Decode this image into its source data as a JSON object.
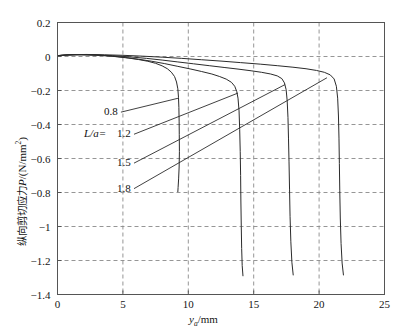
{
  "figure": {
    "background_color": "#ffffff",
    "axis_color": "#555555",
    "grid_color": "#8a8a8a",
    "curve_color": "#2b2b2b"
  },
  "chart_data": {
    "type": "line",
    "title": "",
    "xlabel": "y_a/mm",
    "xlabel_parts": {
      "symbol": "y",
      "subscript": "a",
      "unit": "/mm"
    },
    "ylabel": "纵向剪切应力P/(N/mm²)",
    "ylabel_parts": {
      "chinese": "纵向剪切应力",
      "symbol": "P",
      "unit": "/(N/mm",
      "exponent": "2",
      "unit_close": ")"
    },
    "xlim": [
      0,
      25
    ],
    "ylim": [
      -1.4,
      0.2
    ],
    "xticks": [
      0,
      5,
      10,
      15,
      20,
      25
    ],
    "xtick_labels": [
      "0",
      "5",
      "10",
      "15",
      "20",
      "25"
    ],
    "yticks": [
      0.2,
      0,
      -0.2,
      -0.4,
      -0.6,
      -0.8,
      -1,
      -1.2,
      -1.4
    ],
    "ytick_labels": [
      "0.2",
      "0",
      "−0.2",
      "−0.4",
      "−0.6",
      "−0.8",
      "−1",
      "−1.2",
      "−1.4"
    ],
    "grid": true,
    "grid_style": "dashed",
    "legend_position": "inline-annotations",
    "series_prefix_label": "L/a=",
    "series": [
      {
        "name": "0.8",
        "label": "0.8",
        "label_point": {
          "x": 3.55,
          "y": -0.345
        },
        "leader_to": {
          "x": 9.25,
          "y": -0.245
        },
        "points": [
          [
            0.0,
            0.005
          ],
          [
            0.4,
            0.008
          ],
          [
            0.9,
            0.01
          ],
          [
            1.5,
            0.011
          ],
          [
            2.2,
            0.01
          ],
          [
            3.0,
            0.008
          ],
          [
            3.8,
            0.004
          ],
          [
            4.6,
            -0.002
          ],
          [
            5.4,
            -0.009
          ],
          [
            6.2,
            -0.018
          ],
          [
            6.9,
            -0.028
          ],
          [
            7.5,
            -0.04
          ],
          [
            8.0,
            -0.055
          ],
          [
            8.4,
            -0.072
          ],
          [
            8.7,
            -0.092
          ],
          [
            8.95,
            -0.118
          ],
          [
            9.1,
            -0.15
          ],
          [
            9.2,
            -0.19
          ],
          [
            9.25,
            -0.24
          ],
          [
            9.28,
            -0.3
          ],
          [
            9.3,
            -0.38
          ],
          [
            9.31,
            -0.46
          ],
          [
            9.32,
            -0.56
          ],
          [
            9.3,
            -0.65
          ],
          [
            9.26,
            -0.72
          ],
          [
            9.22,
            -0.77
          ],
          [
            9.2,
            -0.795
          ]
        ]
      },
      {
        "name": "1.2",
        "label": "1.2",
        "label_point": {
          "x": 4.55,
          "y": -0.475
        },
        "leader_to": {
          "x": 13.8,
          "y": -0.215
        },
        "points": [
          [
            0.0,
            0.005
          ],
          [
            0.6,
            0.009
          ],
          [
            1.4,
            0.011
          ],
          [
            2.3,
            0.01
          ],
          [
            3.2,
            0.007
          ],
          [
            4.2,
            0.002
          ],
          [
            5.2,
            -0.006
          ],
          [
            6.2,
            -0.016
          ],
          [
            7.2,
            -0.028
          ],
          [
            8.2,
            -0.042
          ],
          [
            9.2,
            -0.058
          ],
          [
            10.2,
            -0.074
          ],
          [
            11.0,
            -0.088
          ],
          [
            11.8,
            -0.103
          ],
          [
            12.4,
            -0.118
          ],
          [
            12.9,
            -0.133
          ],
          [
            13.3,
            -0.152
          ],
          [
            13.55,
            -0.175
          ],
          [
            13.7,
            -0.205
          ],
          [
            13.8,
            -0.245
          ],
          [
            13.88,
            -0.32
          ],
          [
            13.93,
            -0.43
          ],
          [
            13.97,
            -0.56
          ],
          [
            14.0,
            -0.7
          ],
          [
            14.02,
            -0.85
          ],
          [
            14.05,
            -1.0
          ],
          [
            14.08,
            -1.13
          ],
          [
            14.12,
            -1.23
          ],
          [
            14.18,
            -1.29
          ]
        ]
      },
      {
        "name": "1.5",
        "label": "1.5",
        "label_point": {
          "x": 4.55,
          "y": -0.645
        },
        "leader_to": {
          "x": 17.4,
          "y": -0.165
        },
        "points": [
          [
            0.0,
            0.005
          ],
          [
            0.8,
            0.009
          ],
          [
            1.8,
            0.011
          ],
          [
            3.0,
            0.009
          ],
          [
            4.2,
            0.005
          ],
          [
            5.5,
            -0.002
          ],
          [
            6.8,
            -0.011
          ],
          [
            8.0,
            -0.021
          ],
          [
            9.2,
            -0.032
          ],
          [
            10.4,
            -0.043
          ],
          [
            11.6,
            -0.054
          ],
          [
            12.8,
            -0.065
          ],
          [
            13.8,
            -0.074
          ],
          [
            14.8,
            -0.084
          ],
          [
            15.6,
            -0.093
          ],
          [
            16.3,
            -0.103
          ],
          [
            16.8,
            -0.114
          ],
          [
            17.15,
            -0.13
          ],
          [
            17.35,
            -0.155
          ],
          [
            17.48,
            -0.195
          ],
          [
            17.56,
            -0.26
          ],
          [
            17.62,
            -0.36
          ],
          [
            17.66,
            -0.48
          ],
          [
            17.7,
            -0.62
          ],
          [
            17.74,
            -0.78
          ],
          [
            17.78,
            -0.94
          ],
          [
            17.84,
            -1.09
          ],
          [
            17.92,
            -1.21
          ],
          [
            18.02,
            -1.285
          ]
        ]
      },
      {
        "name": "1.8",
        "label": "1.8",
        "label_point": {
          "x": 4.55,
          "y": -0.795
        },
        "leader_to": {
          "x": 20.6,
          "y": -0.125
        },
        "points": [
          [
            0.0,
            0.005
          ],
          [
            1.0,
            0.01
          ],
          [
            2.2,
            0.012
          ],
          [
            3.6,
            0.01
          ],
          [
            5.0,
            0.007
          ],
          [
            6.5,
            0.002
          ],
          [
            8.0,
            -0.004
          ],
          [
            9.5,
            -0.011
          ],
          [
            11.0,
            -0.019
          ],
          [
            12.5,
            -0.027
          ],
          [
            14.0,
            -0.036
          ],
          [
            15.5,
            -0.045
          ],
          [
            16.8,
            -0.054
          ],
          [
            18.0,
            -0.063
          ],
          [
            19.0,
            -0.072
          ],
          [
            19.8,
            -0.082
          ],
          [
            20.4,
            -0.093
          ],
          [
            20.85,
            -0.108
          ],
          [
            21.15,
            -0.132
          ],
          [
            21.32,
            -0.175
          ],
          [
            21.42,
            -0.245
          ],
          [
            21.48,
            -0.35
          ],
          [
            21.52,
            -0.48
          ],
          [
            21.55,
            -0.63
          ],
          [
            21.58,
            -0.79
          ],
          [
            21.62,
            -0.95
          ],
          [
            21.68,
            -1.1
          ],
          [
            21.76,
            -1.215
          ],
          [
            21.86,
            -1.285
          ]
        ]
      }
    ]
  }
}
